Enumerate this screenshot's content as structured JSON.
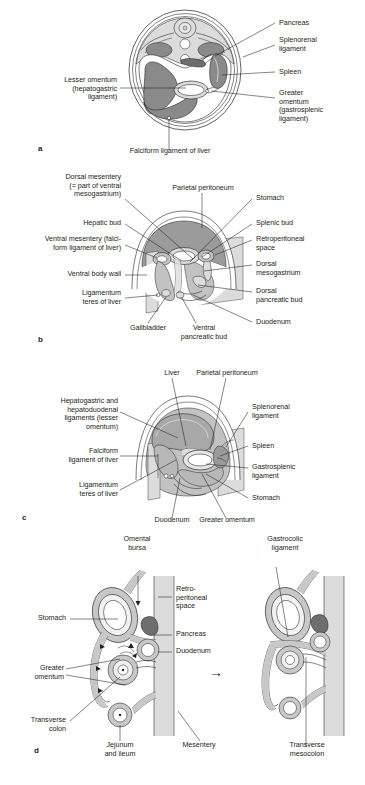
{
  "figure": {
    "palette": {
      "outline": "#231f20",
      "peritoneum_light": "#dcdcdc",
      "organ_mid": "#b4b4b4",
      "organ_dark": "#8a8a8a",
      "organ_darkest": "#6e6e6e",
      "background": "#ffffff",
      "wall_gray": "#d2d2d2"
    }
  },
  "panels": [
    {
      "key": "a",
      "name": "transverse-section-upper-abdomen",
      "labels_left": [
        {
          "id": "lesser-omentum",
          "text": "Lesser omentum\n(hepatogastric\nligament)"
        }
      ],
      "labels_right": [
        {
          "id": "pancreas",
          "text": "Pancreas"
        },
        {
          "id": "splenorenal-ligament",
          "text": "Splenorenal\nligament"
        },
        {
          "id": "spleen",
          "text": "Spleen"
        },
        {
          "id": "greater-omentum",
          "text": "Greater\nomentum\n(gastrosplenic\nligament)"
        }
      ],
      "labels_bottom": [
        {
          "id": "falciform-ligament-of-liver",
          "text": "Falciform ligament of liver"
        }
      ]
    },
    {
      "key": "b",
      "name": "embryonic-mesenteries-sagittal-view",
      "labels_left": [
        {
          "id": "dorsal-mesentery",
          "text": "Dorsal mesentery\n(= part of ventral\nmesogastrium)"
        },
        {
          "id": "hepatic-bud",
          "text": "Hepatic bud"
        },
        {
          "id": "ventral-mesentery",
          "text": "Ventral mesentery (falci-\nform ligament of liver)"
        },
        {
          "id": "ventral-body-wall",
          "text": "Ventral body wall"
        },
        {
          "id": "ligamentum-teres-of-liver",
          "text": "Ligamentum\nteres of liver"
        }
      ],
      "labels_top": [
        {
          "id": "parietal-peritoneum",
          "text": "Parietal peritoneum"
        }
      ],
      "labels_right": [
        {
          "id": "stomach",
          "text": "Stomach"
        },
        {
          "id": "splenic-bud",
          "text": "Splenic bud"
        },
        {
          "id": "retroperitoneal-space",
          "text": "Retroperitoneal\nspace"
        },
        {
          "id": "dorsal-mesogastrium",
          "text": "Dorsal\nmesogastrium"
        },
        {
          "id": "dorsal-pancreatic-bud",
          "text": "Dorsal\npancreatic bud"
        },
        {
          "id": "duodenum",
          "text": "Duodenum"
        }
      ],
      "labels_bottom": [
        {
          "id": "gallbladder",
          "text": "Gallbladder"
        },
        {
          "id": "ventral-pancreatic-bud",
          "text": "Ventral\npancreatic bud"
        }
      ]
    },
    {
      "key": "c",
      "name": "rotated-stomach-peritoneal-ligaments",
      "labels_left": [
        {
          "id": "hepatogastric-hepatoduodenal",
          "text": "Hepatogastric and\nhepatoduodenal\nligaments (lesser\nomentum)"
        },
        {
          "id": "falciform-ligament-of-liver",
          "text": "Falciform\nligament of liver"
        },
        {
          "id": "ligamentum-teres-of-liver",
          "text": "Ligamentum\nteres of liver"
        }
      ],
      "labels_top": [
        {
          "id": "liver",
          "text": "Liver"
        },
        {
          "id": "parietal-peritoneum",
          "text": "Parietal peritoneum"
        }
      ],
      "labels_right": [
        {
          "id": "splenorenal-ligament",
          "text": "Splenorenal\nligament"
        },
        {
          "id": "spleen",
          "text": "Spleen"
        },
        {
          "id": "gastrosplenic-ligament",
          "text": "Gastrosplenic\nligament"
        },
        {
          "id": "stomach",
          "text": "Stomach"
        }
      ],
      "labels_bottom": [
        {
          "id": "duodenum",
          "text": "Duodenum"
        },
        {
          "id": "greater-omentum",
          "text": "Greater omentum"
        }
      ]
    },
    {
      "key": "d",
      "name": "omental-bursa-fusion-sagittal-pair",
      "labels_left": [
        {
          "id": "stomach",
          "text": "Stomach"
        },
        {
          "id": "greater-omentum",
          "text": "Greater\nomentum"
        },
        {
          "id": "transverse-colon",
          "text": "Transverse\ncolon"
        }
      ],
      "labels_top_left": [
        {
          "id": "omental-bursa",
          "text": "Omental\nbursa"
        }
      ],
      "labels_top_right": [
        {
          "id": "gastrocolic-ligament",
          "text": "Gastrocolic\nligament"
        }
      ],
      "labels_mid": [
        {
          "id": "retroperitoneal-space",
          "text": "Retro-\nperitoneal\nspace"
        },
        {
          "id": "pancreas",
          "text": "Pancreas"
        },
        {
          "id": "duodenum",
          "text": "Duodenum"
        }
      ],
      "labels_bottom": [
        {
          "id": "jejunum-and-ileum",
          "text": "Jejunum\nand ileum"
        },
        {
          "id": "mesentery",
          "text": "Mesentery"
        },
        {
          "id": "transverse-mesocolon",
          "text": "Transverse\nmesocolon"
        }
      ],
      "arrow": {
        "id": "transition-arrow",
        "text": "→"
      }
    }
  ],
  "caption": {
    "text": ""
  }
}
